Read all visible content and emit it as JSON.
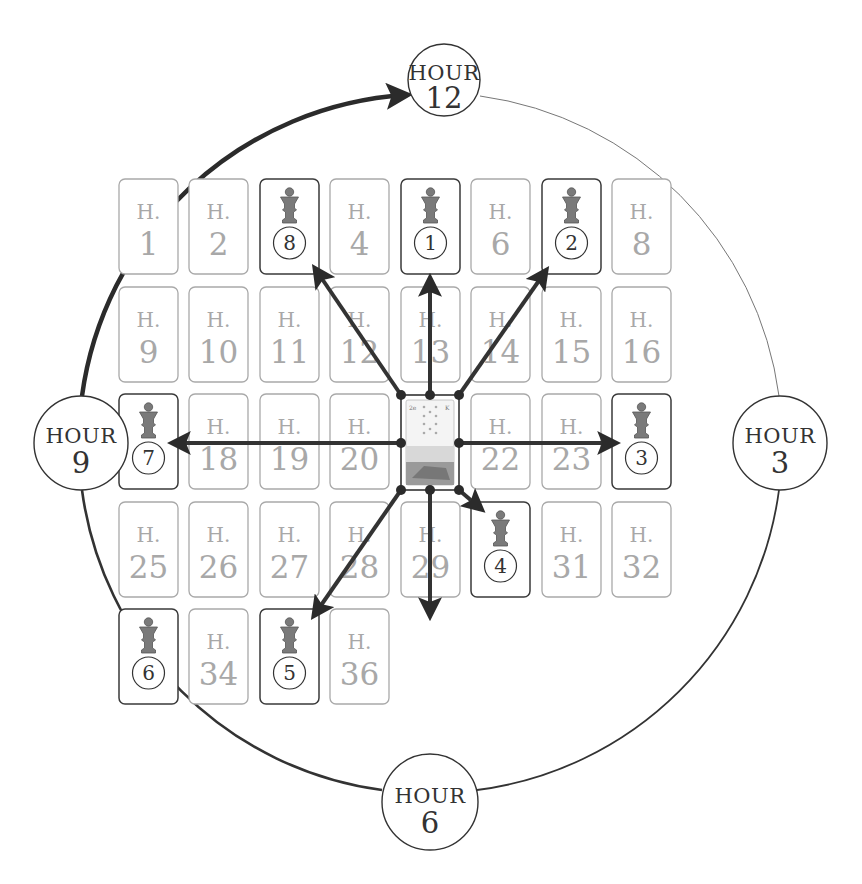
{
  "diagram": {
    "colors": {
      "stroke_dark": "#333333",
      "house_light": "#a8a8a8",
      "piece_fill": "#7a7a7a",
      "background": "#ffffff"
    },
    "hours": [
      {
        "id": "hour-12",
        "label": "HOUR",
        "number": "12"
      },
      {
        "id": "hour-3",
        "label": "HOUR",
        "number": "3"
      },
      {
        "id": "hour-6",
        "label": "HOUR",
        "number": "6"
      },
      {
        "id": "hour-9",
        "label": "HOUR",
        "number": "9"
      }
    ],
    "house_prefix": "H.",
    "houses": [
      {
        "n": "1",
        "token": null
      },
      {
        "n": "2",
        "token": null
      },
      {
        "n": "3",
        "token": "8"
      },
      {
        "n": "4",
        "token": null
      },
      {
        "n": "5",
        "token": "1"
      },
      {
        "n": "6",
        "token": null
      },
      {
        "n": "7",
        "token": "2"
      },
      {
        "n": "8",
        "token": null
      },
      {
        "n": "9",
        "token": null
      },
      {
        "n": "10",
        "token": null
      },
      {
        "n": "11",
        "token": null
      },
      {
        "n": "12",
        "token": null
      },
      {
        "n": "13",
        "token": null
      },
      {
        "n": "14",
        "token": null
      },
      {
        "n": "15",
        "token": null
      },
      {
        "n": "16",
        "token": null
      },
      {
        "n": "17",
        "token": "7"
      },
      {
        "n": "18",
        "token": null
      },
      {
        "n": "19",
        "token": null
      },
      {
        "n": "20",
        "token": null
      },
      {
        "n": "21",
        "token": "center-card"
      },
      {
        "n": "22",
        "token": null
      },
      {
        "n": "23",
        "token": null
      },
      {
        "n": "24",
        "token": "3"
      },
      {
        "n": "25",
        "token": null
      },
      {
        "n": "26",
        "token": null
      },
      {
        "n": "27",
        "token": null
      },
      {
        "n": "28",
        "token": null
      },
      {
        "n": "29",
        "token": null
      },
      {
        "n": "30",
        "token": "4"
      },
      {
        "n": "31",
        "token": null
      },
      {
        "n": "32",
        "token": null
      },
      {
        "n": "33",
        "token": "6"
      },
      {
        "n": "34",
        "token": null
      },
      {
        "n": "35",
        "token": "5"
      },
      {
        "n": "36",
        "token": null
      }
    ],
    "center_card": {
      "corner_left": "2e",
      "corner_right": "K"
    },
    "arrows": [
      {
        "to_token": "1",
        "direction": "up"
      },
      {
        "to_token": "2",
        "direction": "up-right"
      },
      {
        "to_token": "3",
        "direction": "right"
      },
      {
        "to_token": "4",
        "direction": "down-right"
      },
      {
        "to_token": "5",
        "direction": "down"
      },
      {
        "to_token": "6",
        "direction": "down-left"
      },
      {
        "to_token": "7",
        "direction": "left"
      },
      {
        "to_token": "8",
        "direction": "up-left"
      }
    ],
    "clock_arc": {
      "from": "HOUR 9",
      "to": "HOUR 12",
      "style": "thick arrow"
    }
  }
}
